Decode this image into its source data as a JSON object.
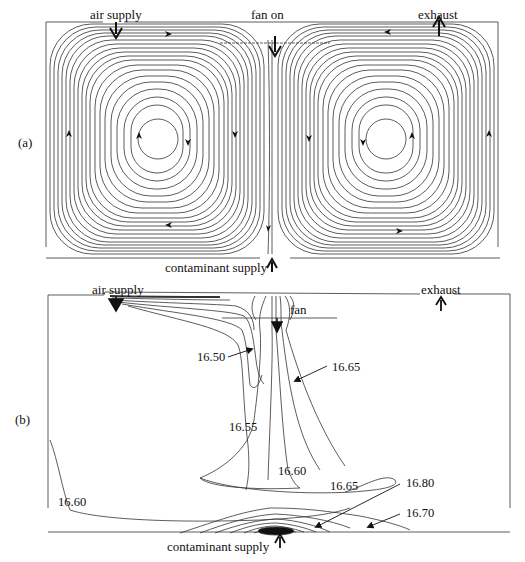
{
  "figure": {
    "panel_a": {
      "tag": "(a)",
      "labels": {
        "air_supply": "air supply",
        "fan": "fan on",
        "exhaust": "exhaust",
        "contaminant_supply": "contaminant supply"
      },
      "stroke_color": "#333333"
    },
    "panel_b": {
      "tag": "(b)",
      "labels": {
        "air_supply": "air supply",
        "fan": "fan",
        "exhaust": "exhaust",
        "contaminant_supply": "contaminant supply"
      },
      "contour_values": [
        "16.50",
        "16.65",
        "16.55",
        "16.60",
        "16.60",
        "16.65",
        "16.80",
        "16.70"
      ],
      "stroke_color": "#333333"
    }
  }
}
